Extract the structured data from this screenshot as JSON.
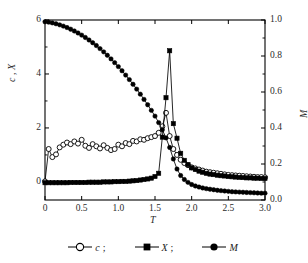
{
  "figure": {
    "background": "#ffffff",
    "ink": "#000000"
  },
  "axes": {
    "x_label": "T",
    "y_left_label": "c , X",
    "y_right_label": "M",
    "x_ticks": [
      "0",
      "0.5",
      "1.0",
      "1.5",
      "2.0",
      "2.5",
      "3.0"
    ],
    "y_left_ticks": [
      "0",
      "2",
      "4",
      "6"
    ],
    "y_right_ticks": [
      "0.0",
      "0.2",
      "0.4",
      "0.6",
      "0.8",
      "1.0"
    ]
  },
  "legend": {
    "items": [
      {
        "symbol": "open-circle",
        "label": "c",
        "separator": ";"
      },
      {
        "symbol": "filled-square",
        "label": "X",
        "separator": ";"
      },
      {
        "symbol": "filled-circle",
        "label": "M",
        "separator": ""
      }
    ]
  },
  "chart_data": {
    "type": "line",
    "title": "",
    "xlabel": "T",
    "ylabel": "c , X",
    "y2label": "M",
    "xlim": [
      0.0,
      3.0
    ],
    "ylim": [
      -0.67,
      6.0
    ],
    "y2lim": [
      0.0,
      1.0
    ],
    "grid": false,
    "legend_position": "below",
    "series": [
      {
        "name": "c",
        "axis": "left",
        "marker": "open-circle",
        "marker_fill": "#ffffff",
        "color": "#000000",
        "x": [
          0.0,
          0.05,
          0.1,
          0.15,
          0.2,
          0.25,
          0.3,
          0.35,
          0.4,
          0.45,
          0.5,
          0.55,
          0.6,
          0.65,
          0.7,
          0.75,
          0.8,
          0.85,
          0.9,
          0.95,
          1.0,
          1.05,
          1.1,
          1.15,
          1.2,
          1.25,
          1.3,
          1.35,
          1.4,
          1.45,
          1.5,
          1.55,
          1.6,
          1.65,
          1.7,
          1.75,
          1.8,
          1.85,
          1.9,
          1.95,
          2.0,
          2.05,
          2.1,
          2.15,
          2.2,
          2.25,
          2.3,
          2.35,
          2.4,
          2.45,
          2.5,
          2.55,
          2.6,
          2.65,
          2.7,
          2.75,
          2.8,
          2.85,
          2.9,
          2.95,
          3.0
        ],
        "y": [
          0.02,
          1.22,
          0.92,
          1.02,
          1.28,
          1.38,
          1.46,
          1.4,
          1.5,
          1.42,
          1.56,
          1.34,
          1.26,
          1.4,
          1.32,
          1.24,
          1.36,
          1.26,
          1.18,
          1.22,
          1.38,
          1.32,
          1.44,
          1.4,
          1.52,
          1.5,
          1.58,
          1.56,
          1.62,
          1.66,
          1.7,
          1.82,
          2.06,
          2.56,
          1.7,
          1.22,
          1.0,
          0.82,
          0.7,
          0.62,
          0.54,
          0.5,
          0.46,
          0.42,
          0.38,
          0.36,
          0.34,
          0.32,
          0.3,
          0.28,
          0.26,
          0.25,
          0.24,
          0.23,
          0.22,
          0.21,
          0.2,
          0.19,
          0.18,
          0.18,
          0.17
        ]
      },
      {
        "name": "X",
        "axis": "left",
        "marker": "filled-square",
        "marker_fill": "#000000",
        "color": "#000000",
        "x": [
          0.0,
          0.05,
          0.1,
          0.15,
          0.2,
          0.25,
          0.3,
          0.35,
          0.4,
          0.45,
          0.5,
          0.55,
          0.6,
          0.65,
          0.7,
          0.75,
          0.8,
          0.85,
          0.9,
          0.95,
          1.0,
          1.05,
          1.1,
          1.15,
          1.2,
          1.25,
          1.3,
          1.35,
          1.4,
          1.45,
          1.5,
          1.55,
          1.6,
          1.65,
          1.7,
          1.75,
          1.8,
          1.85,
          1.9,
          1.95,
          2.0,
          2.05,
          2.1,
          2.15,
          2.2,
          2.25,
          2.3,
          2.35,
          2.4,
          2.45,
          2.5,
          2.55,
          2.6,
          2.65,
          2.7,
          2.75,
          2.8,
          2.85,
          2.9,
          2.95,
          3.0
        ],
        "y": [
          -0.03,
          -0.03,
          -0.03,
          -0.03,
          -0.03,
          -0.03,
          -0.03,
          -0.02,
          -0.02,
          -0.02,
          -0.02,
          -0.02,
          -0.01,
          -0.01,
          -0.01,
          -0.01,
          0.0,
          0.0,
          0.0,
          0.01,
          0.01,
          0.02,
          0.02,
          0.03,
          0.04,
          0.05,
          0.07,
          0.09,
          0.11,
          0.14,
          0.2,
          0.32,
          1.66,
          3.12,
          4.86,
          2.16,
          1.62,
          1.06,
          0.8,
          0.64,
          0.52,
          0.46,
          0.4,
          0.36,
          0.32,
          0.29,
          0.27,
          0.25,
          0.23,
          0.22,
          0.2,
          0.19,
          0.18,
          0.17,
          0.16,
          0.15,
          0.15,
          0.14,
          0.14,
          0.13,
          0.13
        ]
      },
      {
        "name": "M",
        "axis": "right",
        "marker": "filled-circle",
        "marker_fill": "#000000",
        "color": "#000000",
        "x": [
          0.0,
          0.05,
          0.1,
          0.15,
          0.2,
          0.25,
          0.3,
          0.35,
          0.4,
          0.45,
          0.5,
          0.55,
          0.6,
          0.65,
          0.7,
          0.75,
          0.8,
          0.85,
          0.9,
          0.95,
          1.0,
          1.05,
          1.1,
          1.15,
          1.2,
          1.25,
          1.3,
          1.35,
          1.4,
          1.45,
          1.5,
          1.55,
          1.6,
          1.65,
          1.7,
          1.75,
          1.8,
          1.85,
          1.9,
          1.95,
          2.0,
          2.05,
          2.1,
          2.15,
          2.2,
          2.25,
          2.3,
          2.35,
          2.4,
          2.45,
          2.5,
          2.55,
          2.6,
          2.65,
          2.7,
          2.75,
          2.8,
          2.85,
          2.9,
          2.95,
          3.0
        ],
        "y": [
          0.99,
          0.988,
          0.984,
          0.979,
          0.973,
          0.966,
          0.958,
          0.949,
          0.939,
          0.928,
          0.916,
          0.903,
          0.889,
          0.874,
          0.858,
          0.841,
          0.823,
          0.804,
          0.784,
          0.763,
          0.741,
          0.718,
          0.694,
          0.669,
          0.643,
          0.616,
          0.588,
          0.559,
          0.529,
          0.498,
          0.466,
          0.43,
          0.39,
          0.345,
          0.292,
          0.228,
          0.172,
          0.136,
          0.114,
          0.098,
          0.086,
          0.078,
          0.072,
          0.067,
          0.063,
          0.06,
          0.057,
          0.054,
          0.052,
          0.05,
          0.048,
          0.046,
          0.045,
          0.044,
          0.043,
          0.042,
          0.041,
          0.04,
          0.039,
          0.038,
          0.038
        ]
      }
    ]
  }
}
